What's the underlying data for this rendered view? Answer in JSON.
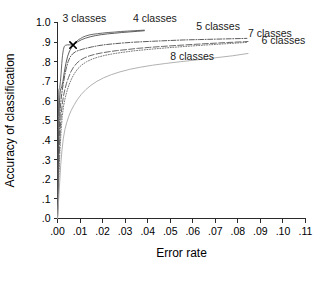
{
  "chart_data": {
    "type": "line",
    "title": "",
    "xlabel": "Error rate",
    "ylabel": "Accuracy of classification",
    "xlim": [
      0.0,
      0.11
    ],
    "ylim": [
      0.0,
      1.0
    ],
    "grid": false,
    "legend_position": "inline-annotations",
    "xticks": [
      0.0,
      0.01,
      0.02,
      0.03,
      0.04,
      0.05,
      0.06,
      0.07,
      0.08,
      0.09,
      0.1,
      0.11
    ],
    "xticklabels": [
      ".00",
      ".01",
      ".02",
      ".03",
      ".04",
      ".05",
      ".06",
      ".07",
      ".08",
      ".09",
      ".10",
      ".11"
    ],
    "yticks": [
      0.0,
      0.1,
      0.2,
      0.3,
      0.4,
      0.5,
      0.6,
      0.7,
      0.8,
      0.9,
      1.0
    ],
    "yticklabels": [
      ".0",
      ".1",
      ".2",
      ".3",
      ".4",
      ".5",
      ".6",
      ".7",
      ".8",
      ".9",
      "1.0"
    ],
    "annotations": [
      {
        "text": "3 classes",
        "x": 0.0022,
        "y": 1.005,
        "name": "label-3-classes"
      },
      {
        "text": "4 classes",
        "x": 0.0335,
        "y": 1.005,
        "name": "label-4-classes"
      },
      {
        "text": "5 classes",
        "x": 0.0615,
        "y": 0.962,
        "name": "label-5-classes"
      },
      {
        "text": "7 classes",
        "x": 0.0845,
        "y": 0.928,
        "name": "label-7-classes"
      },
      {
        "text": "6 classes",
        "x": 0.0905,
        "y": 0.888,
        "name": "label-6-classes"
      },
      {
        "text": "8 classes",
        "x": 0.05,
        "y": 0.808,
        "name": "label-8-classes"
      }
    ],
    "markers": [
      {
        "name": "operating-point-marker",
        "symbol": "x",
        "x": 0.0069,
        "y": 0.885,
        "series": "3 classes"
      }
    ],
    "series": [
      {
        "name": "3 classes",
        "color": "#595959",
        "style": "solid",
        "width": 0.9,
        "points": [
          [
            0.0,
            0.0
          ],
          [
            0.0002,
            0.34
          ],
          [
            0.0003,
            0.43
          ],
          [
            0.0004,
            0.52
          ],
          [
            0.0005,
            0.6
          ],
          [
            0.0006,
            0.655
          ],
          [
            0.0008,
            0.663
          ],
          [
            0.001,
            0.668
          ],
          [
            0.0013,
            0.7
          ],
          [
            0.0016,
            0.742
          ],
          [
            0.0019,
            0.79
          ],
          [
            0.0022,
            0.83
          ],
          [
            0.0026,
            0.862
          ],
          [
            0.003,
            0.878
          ],
          [
            0.0036,
            0.884
          ],
          [
            0.0045,
            0.886
          ],
          [
            0.0055,
            0.886
          ],
          [
            0.0069,
            0.885
          ],
          [
            0.0078,
            0.894
          ],
          [
            0.0086,
            0.905
          ],
          [
            0.0094,
            0.913
          ],
          [
            0.0102,
            0.918
          ],
          [
            0.0112,
            0.925
          ],
          [
            0.0125,
            0.931
          ],
          [
            0.014,
            0.936
          ],
          [
            0.0158,
            0.94
          ],
          [
            0.0178,
            0.943
          ],
          [
            0.02,
            0.946
          ],
          [
            0.0225,
            0.949
          ],
          [
            0.0252,
            0.951
          ],
          [
            0.028,
            0.954
          ],
          [
            0.031,
            0.956
          ],
          [
            0.034,
            0.958
          ],
          [
            0.037,
            0.96
          ],
          [
            0.0385,
            0.961
          ]
        ]
      },
      {
        "name": "4 classes",
        "color": "#4d4d4d",
        "style": "solid",
        "width": 0.9,
        "points": [
          [
            0.0,
            0.0
          ],
          [
            0.0003,
            0.3
          ],
          [
            0.0005,
            0.42
          ],
          [
            0.0007,
            0.52
          ],
          [
            0.0009,
            0.6
          ],
          [
            0.0012,
            0.65
          ],
          [
            0.0015,
            0.662
          ],
          [
            0.0019,
            0.672
          ],
          [
            0.0024,
            0.7
          ],
          [
            0.003,
            0.745
          ],
          [
            0.0037,
            0.79
          ],
          [
            0.0045,
            0.828
          ],
          [
            0.0054,
            0.856
          ],
          [
            0.0064,
            0.875
          ],
          [
            0.0076,
            0.89
          ],
          [
            0.009,
            0.902
          ],
          [
            0.0106,
            0.912
          ],
          [
            0.0124,
            0.92
          ],
          [
            0.0145,
            0.927
          ],
          [
            0.0168,
            0.933
          ],
          [
            0.0194,
            0.938
          ],
          [
            0.0222,
            0.942
          ],
          [
            0.0252,
            0.945
          ],
          [
            0.0285,
            0.949
          ],
          [
            0.032,
            0.952
          ],
          [
            0.0355,
            0.955
          ],
          [
            0.0385,
            0.958
          ]
        ]
      },
      {
        "name": "5 classes",
        "color": "#4a4a4a",
        "style": "dashdot",
        "width": 0.9,
        "points": [
          [
            0.0,
            0.0
          ],
          [
            0.0004,
            0.26
          ],
          [
            0.0007,
            0.4
          ],
          [
            0.001,
            0.5
          ],
          [
            0.0013,
            0.57
          ],
          [
            0.0017,
            0.62
          ],
          [
            0.0021,
            0.655
          ],
          [
            0.0026,
            0.69
          ],
          [
            0.0032,
            0.73
          ],
          [
            0.0039,
            0.768
          ],
          [
            0.0047,
            0.8
          ],
          [
            0.0056,
            0.824
          ],
          [
            0.0067,
            0.84
          ],
          [
            0.008,
            0.851
          ],
          [
            0.0095,
            0.858
          ],
          [
            0.0112,
            0.864
          ],
          [
            0.0132,
            0.87
          ],
          [
            0.0155,
            0.876
          ],
          [
            0.0182,
            0.882
          ],
          [
            0.0212,
            0.887
          ],
          [
            0.0246,
            0.891
          ],
          [
            0.0285,
            0.895
          ],
          [
            0.033,
            0.899
          ],
          [
            0.038,
            0.902
          ],
          [
            0.0435,
            0.905
          ],
          [
            0.0495,
            0.908
          ],
          [
            0.056,
            0.911
          ],
          [
            0.063,
            0.913
          ],
          [
            0.07,
            0.915
          ],
          [
            0.077,
            0.917
          ],
          [
            0.084,
            0.919
          ]
        ]
      },
      {
        "name": "6 classes",
        "color": "#585858",
        "style": "longdash",
        "width": 0.9,
        "points": [
          [
            0.0,
            0.0
          ],
          [
            0.0005,
            0.23
          ],
          [
            0.0009,
            0.37
          ],
          [
            0.0013,
            0.47
          ],
          [
            0.0017,
            0.54
          ],
          [
            0.0022,
            0.59
          ],
          [
            0.0027,
            0.628
          ],
          [
            0.0033,
            0.66
          ],
          [
            0.004,
            0.69
          ],
          [
            0.0049,
            0.72
          ],
          [
            0.0059,
            0.748
          ],
          [
            0.0071,
            0.772
          ],
          [
            0.0085,
            0.792
          ],
          [
            0.0101,
            0.808
          ],
          [
            0.012,
            0.82
          ],
          [
            0.0142,
            0.83
          ],
          [
            0.0167,
            0.838
          ],
          [
            0.0196,
            0.845
          ],
          [
            0.0229,
            0.851
          ],
          [
            0.0266,
            0.857
          ],
          [
            0.0308,
            0.862
          ],
          [
            0.0355,
            0.868
          ],
          [
            0.0408,
            0.873
          ],
          [
            0.0466,
            0.878
          ],
          [
            0.053,
            0.883
          ],
          [
            0.06,
            0.888
          ],
          [
            0.0675,
            0.893
          ],
          [
            0.0755,
            0.898
          ],
          [
            0.083,
            0.902
          ],
          [
            0.0845,
            0.903
          ]
        ]
      },
      {
        "name": "7 classes",
        "color": "#6b6b6b",
        "style": "dotted",
        "width": 0.9,
        "points": [
          [
            0.0,
            0.0
          ],
          [
            0.0006,
            0.21
          ],
          [
            0.0011,
            0.35
          ],
          [
            0.0016,
            0.45
          ],
          [
            0.0021,
            0.52
          ],
          [
            0.0027,
            0.575
          ],
          [
            0.0034,
            0.615
          ],
          [
            0.0042,
            0.65
          ],
          [
            0.0051,
            0.682
          ],
          [
            0.0062,
            0.712
          ],
          [
            0.0075,
            0.74
          ],
          [
            0.009,
            0.764
          ],
          [
            0.0108,
            0.784
          ],
          [
            0.0129,
            0.8
          ],
          [
            0.0153,
            0.813
          ],
          [
            0.0181,
            0.824
          ],
          [
            0.0213,
            0.833
          ],
          [
            0.0249,
            0.841
          ],
          [
            0.029,
            0.848
          ],
          [
            0.0336,
            0.855
          ],
          [
            0.0388,
            0.861
          ],
          [
            0.0446,
            0.867
          ],
          [
            0.051,
            0.873
          ],
          [
            0.058,
            0.879
          ],
          [
            0.0656,
            0.885
          ],
          [
            0.0738,
            0.891
          ],
          [
            0.082,
            0.897
          ],
          [
            0.0845,
            0.899
          ]
        ]
      },
      {
        "name": "8 classes",
        "color": "#a8a8a8",
        "style": "solid",
        "width": 0.9,
        "points": [
          [
            0.0,
            0.0
          ],
          [
            0.0008,
            0.15
          ],
          [
            0.0014,
            0.27
          ],
          [
            0.002,
            0.35
          ],
          [
            0.0026,
            0.41
          ],
          [
            0.0033,
            0.455
          ],
          [
            0.0041,
            0.49
          ],
          [
            0.005,
            0.522
          ],
          [
            0.0061,
            0.552
          ],
          [
            0.0074,
            0.58
          ],
          [
            0.0089,
            0.608
          ],
          [
            0.0106,
            0.634
          ],
          [
            0.0126,
            0.658
          ],
          [
            0.0149,
            0.68
          ],
          [
            0.0175,
            0.7
          ],
          [
            0.0205,
            0.718
          ],
          [
            0.0239,
            0.734
          ],
          [
            0.0277,
            0.748
          ],
          [
            0.032,
            0.761
          ],
          [
            0.0368,
            0.772
          ],
          [
            0.0421,
            0.782
          ],
          [
            0.048,
            0.791
          ],
          [
            0.0545,
            0.8
          ],
          [
            0.0616,
            0.809
          ],
          [
            0.0693,
            0.819
          ],
          [
            0.0775,
            0.83
          ],
          [
            0.0845,
            0.842
          ]
        ]
      }
    ]
  }
}
